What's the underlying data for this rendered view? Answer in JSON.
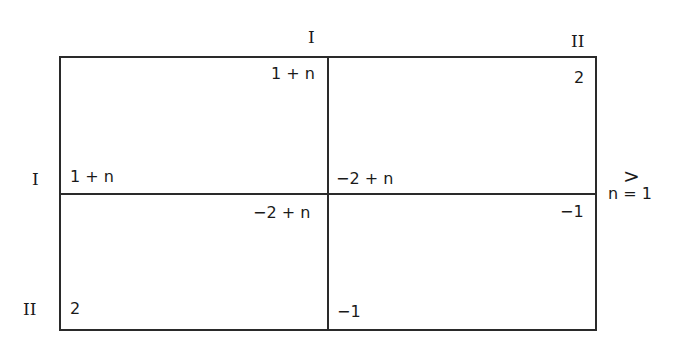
{
  "matrix": {
    "col_labels": [
      "I",
      "II"
    ],
    "row_labels": [
      "I",
      "II"
    ],
    "cells": [
      [
        {
          "row_payoff": "1 + n",
          "col_payoff": "1 + n"
        },
        {
          "row_payoff": "−2 + n",
          "col_payoff": "2"
        }
      ],
      [
        {
          "row_payoff": "2",
          "col_payoff": "−2 + n"
        },
        {
          "row_payoff": "−1",
          "col_payoff": "−1"
        }
      ]
    ],
    "side_note": {
      "symbol": ">",
      "condition": "n = 1"
    }
  }
}
